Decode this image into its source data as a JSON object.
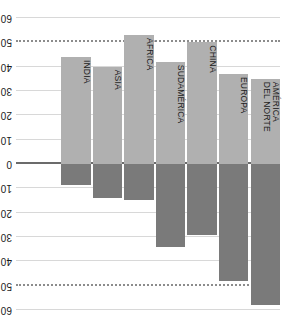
{
  "chart_data": {
    "type": "bar",
    "title": "",
    "subtitle": "",
    "xlabel": "",
    "ylabel": "",
    "unit": "g",
    "orientation": "vertical",
    "grid": true,
    "legend": false,
    "ylim": [
      -60,
      60
    ],
    "yticks": [
      60,
      50,
      40,
      30,
      20,
      10,
      0,
      10,
      20,
      30,
      40,
      50,
      60
    ],
    "ytick_labels": [
      "60 g",
      "50",
      "40",
      "30",
      "20",
      "10",
      "0",
      "10",
      "20",
      "30",
      "40",
      "50",
      "60 g"
    ],
    "highlight_gridlines": [
      50,
      -50
    ],
    "categories": [
      "AMÉRICA\nDEL NORTE",
      "EUROPA",
      "CHINA",
      "SUDAMÉRICA",
      "ÁFRICA",
      "ASIA",
      "INDIA"
    ],
    "series": [
      {
        "name": "positive",
        "color": "#7a7a7a",
        "values": [
          58,
          48,
          29,
          34,
          15,
          14,
          8.5
        ]
      },
      {
        "name": "negative",
        "color": "#b0b0b0",
        "values": [
          -35,
          -37,
          -50,
          -42,
          -53,
          -40,
          -44
        ]
      }
    ]
  },
  "axis": {
    "tick_0": "0",
    "tick_10": "10",
    "tick_20": "20",
    "tick_30": "30",
    "tick_40": "40",
    "tick_50": "50",
    "tick_60_value": "60",
    "tick_60_unit": "g"
  },
  "colors": {
    "bar_positive": "#7a7a7a",
    "bar_negative": "#b0b0b0",
    "gridline": "#d8d8d8",
    "gridline_highlight": "#8c8c8c",
    "zero_line": "#6b6b6b",
    "text": "#1a1a1a",
    "background": "#ffffff"
  }
}
